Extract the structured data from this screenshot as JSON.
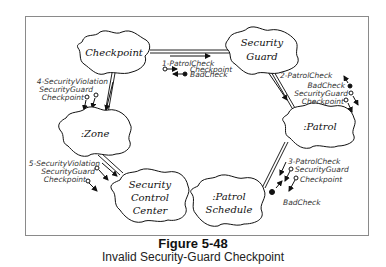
{
  "diagram": {
    "objects": {
      "checkpoint": "Checkpoint",
      "security_guard_1": "Security",
      "security_guard_2": "Guard",
      "zone": ":Zone",
      "patrol": ":Patrol",
      "scc_1": "Security",
      "scc_2": "Control",
      "scc_3": "Center",
      "ps_1": ":Patrol",
      "ps_2": "Schedule"
    },
    "messages": {
      "m1": {
        "name": "1-PatrolCheck",
        "arg1": "Checkpoint",
        "arg2": "BadCheck"
      },
      "m2": {
        "name": "2-PatrolCheck",
        "arg1": "BadCheck",
        "arg2": "SecurityGuard",
        "arg3": "Checkpoint"
      },
      "m3": {
        "name": "3-PatrolCheck",
        "arg1": "SecurityGuard",
        "arg2": "Checkpoint",
        "arg3": "BadCheck"
      },
      "m4": {
        "name": "4-SecurityViolation",
        "arg1": "SecurityGuard",
        "arg2": "Checkpoint"
      },
      "m5": {
        "name": "5-SecurityViolation",
        "arg1": "SecurityGuard",
        "arg2": "Checkpoint"
      }
    }
  },
  "caption": {
    "title": "Figure 5-48",
    "subtitle": "Invalid Security-Guard Checkpoint"
  }
}
